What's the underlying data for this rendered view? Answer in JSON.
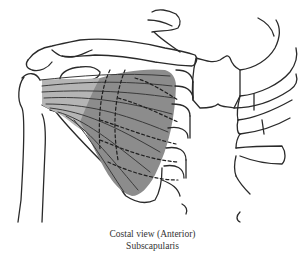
{
  "figure": {
    "view": "Costal view (Anterior)",
    "muscle": "Subscapularis",
    "colors": {
      "line": "#2a2a2a",
      "muscle_fill": "#8c8c8c",
      "tendon_fill": "#b5b5b5",
      "background": "#ffffff"
    },
    "structures": [
      "clavicle",
      "scapula",
      "humerus",
      "ribs",
      "sternum",
      "subscapularis-muscle"
    ]
  }
}
